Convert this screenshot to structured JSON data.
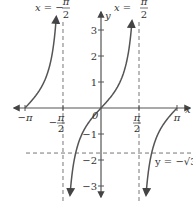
{
  "chart_data": {
    "type": "line",
    "title": "",
    "function": "y = tan(x)",
    "xlabel": "x",
    "ylabel": "y",
    "xlim": [
      -3.6,
      3.5
    ],
    "ylim": [
      -3.5,
      3.9
    ],
    "grid": false,
    "x_ticks": [
      {
        "value": -3.14159,
        "label": "−π"
      },
      {
        "value": -1.5708,
        "label_num": "π",
        "label_sign": "−",
        "label_den": "2"
      },
      {
        "value": 1.5708,
        "label_num": "π",
        "label_den": "2"
      },
      {
        "value": 3.14159,
        "label": "π"
      }
    ],
    "y_ticks": [
      {
        "value": 3,
        "label": "3"
      },
      {
        "value": 2,
        "label": "2"
      },
      {
        "value": 1,
        "label": "1"
      },
      {
        "value": -1,
        "label": "−1"
      },
      {
        "value": -2,
        "label": "−2"
      },
      {
        "value": -3,
        "label": "−3"
      }
    ],
    "origin_label": "0",
    "series": [
      {
        "name": "tan branch 1",
        "x_range": [
          -3.14159,
          -1.62
        ],
        "values_desc": "tan(x) from 0 rising toward +∞"
      },
      {
        "name": "tan branch 2",
        "x_range": [
          -1.45,
          1.45
        ],
        "values_desc": "tan(x) from −∞ to +∞ through origin"
      },
      {
        "name": "tan branch 3",
        "x_range": [
          1.62,
          3.14159
        ],
        "values_desc": "tan(x) from −∞ rising to 0"
      }
    ],
    "asymptotes": [
      {
        "type": "vertical",
        "value": -1.5708,
        "label_lhs": "x = −",
        "label_num": "π",
        "label_den": "2"
      },
      {
        "type": "vertical",
        "value": 1.5708,
        "label_lhs": "x = ",
        "label_num": "π",
        "label_den": "2"
      }
    ],
    "reference_lines": [
      {
        "type": "horizontal",
        "value": -1.73205,
        "label": "y = −√3"
      }
    ],
    "colors": {
      "curve": "#555555",
      "axis": "#555555",
      "dashed": "#777777",
      "text": "#333333"
    }
  }
}
